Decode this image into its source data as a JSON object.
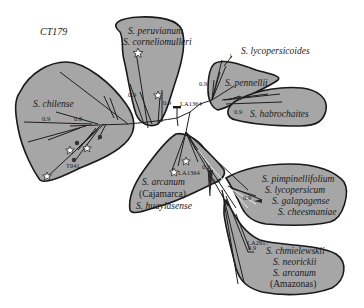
{
  "figure": {
    "title": "CT179",
    "type": "unrooted phylogenetic tree with clade groupings",
    "fill_color": "#a6a6a6",
    "outline_color": "#1a1a1a"
  },
  "clades": [
    {
      "id": "peruvianum",
      "lines": [
        "S. peruvianum",
        "S. corneliomulleri"
      ]
    },
    {
      "id": "chilense",
      "lines": [
        "S. chilense"
      ]
    },
    {
      "id": "pennellii",
      "lines": [
        "S. pennellii"
      ]
    },
    {
      "id": "habrochaites",
      "lines": [
        "S. habrochaites"
      ]
    },
    {
      "id": "lycopersicoides",
      "lines": [
        "S. lycopersicoides"
      ]
    },
    {
      "id": "arcanum-cajamarca",
      "lines": [
        "S. arcanum",
        "(Cajamarca)",
        "S. huaylasense"
      ]
    },
    {
      "id": "esculentum",
      "lines": [
        "S. pimpinellifolium",
        "S. lycopersicum",
        "S. galapagense",
        "S. cheesmaniae"
      ]
    },
    {
      "id": "chmielewskii",
      "lines": [
        "S. chmielewskii",
        "S. neorickii",
        "S. arcanum",
        "(Amazonas)"
      ]
    }
  ],
  "support_values": {
    "peru_a": "0.9",
    "peru_b": "0.9",
    "chil_a": "0.9",
    "chil_b": "0.8",
    "penn": "0.9",
    "lyco": "1",
    "habro": "0.9",
    "arc_a": "0.9",
    "arc_b": "0.8",
    "esc": "0.9",
    "chm": "0.9"
  },
  "accessions": {
    "la1364_top": "LA1364",
    "la1364_mid": "LA1364",
    "t041": "T041",
    "la2917": "LA2917"
  }
}
